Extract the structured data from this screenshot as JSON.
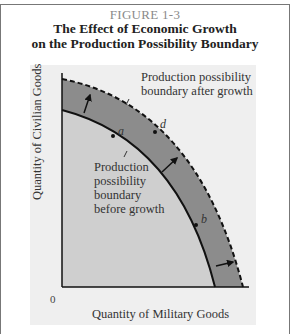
{
  "figure": {
    "number": "FIGURE 1-3",
    "title_line1": "The Effect of Economic Growth",
    "title_line2": "on the Production Possibility Boundary"
  },
  "axes": {
    "ylabel": "Quantity of Civilian Goods",
    "xlabel": "Quantity of Military Goods",
    "origin": "0"
  },
  "annotations": {
    "after_line1": "Production possibility",
    "after_line2": "boundary after growth",
    "before_line1": "Production",
    "before_line2": "possibility",
    "before_line3": "boundary",
    "before_line4": "before growth"
  },
  "points": {
    "a": "a",
    "b": "b",
    "d": "d"
  },
  "colors": {
    "panel_bg": "#efefef",
    "inner_region": "#cfcfcf",
    "growth_band": "#8c8c8c",
    "curve": "#111111"
  }
}
